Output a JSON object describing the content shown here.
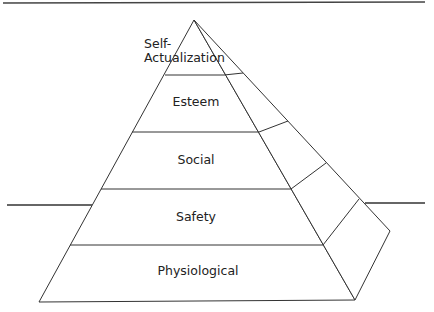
{
  "diagram": {
    "type": "pyramid",
    "levels": [
      {
        "label_line1": "Self-",
        "label_line2": "Actualization"
      },
      {
        "label": "Esteem"
      },
      {
        "label": "Social"
      },
      {
        "label": "Safety"
      },
      {
        "label": "Physiological"
      }
    ],
    "colors": {
      "line": "#333333",
      "background": "#ffffff"
    }
  }
}
